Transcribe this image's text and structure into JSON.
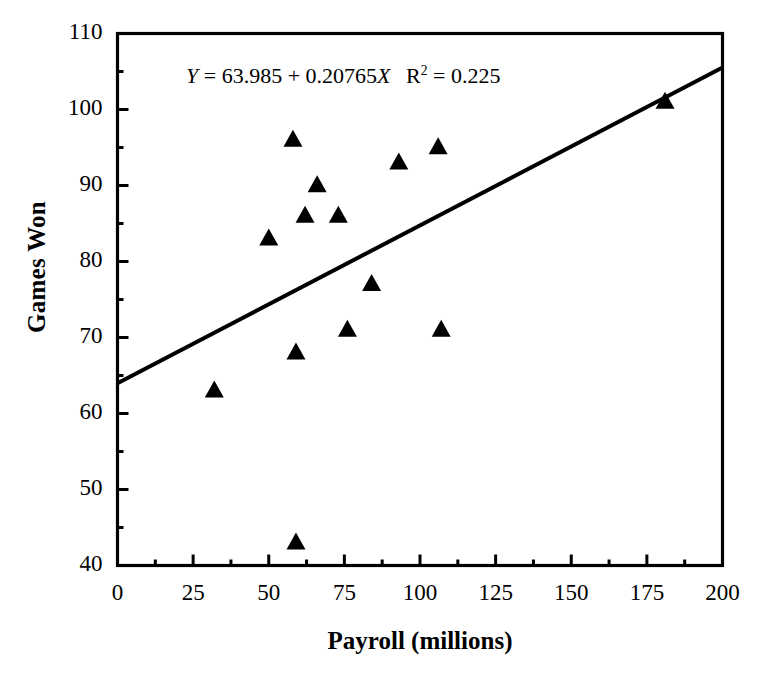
{
  "chart_data": {
    "type": "scatter",
    "title": "",
    "xlabel": "Payroll (millions)",
    "ylabel": "Games Won",
    "xlim": [
      0,
      200
    ],
    "ylim": [
      40,
      110
    ],
    "xticks": [
      0,
      25,
      50,
      75,
      100,
      125,
      150,
      175,
      200
    ],
    "yticks": [
      40,
      50,
      60,
      70,
      80,
      90,
      100,
      110
    ],
    "xminor_step": 12.5,
    "yminor_step": 5,
    "grid": false,
    "legend": null,
    "marker": "triangle-up",
    "marker_color": "#000000",
    "points": [
      {
        "x": 32,
        "y": 63
      },
      {
        "x": 50,
        "y": 83
      },
      {
        "x": 58,
        "y": 96
      },
      {
        "x": 59,
        "y": 68
      },
      {
        "x": 59,
        "y": 43
      },
      {
        "x": 62,
        "y": 86
      },
      {
        "x": 66,
        "y": 90
      },
      {
        "x": 73,
        "y": 86
      },
      {
        "x": 76,
        "y": 71
      },
      {
        "x": 84,
        "y": 77
      },
      {
        "x": 93,
        "y": 93
      },
      {
        "x": 106,
        "y": 95
      },
      {
        "x": 107,
        "y": 71
      },
      {
        "x": 181,
        "y": 101
      }
    ],
    "fit_line": {
      "intercept": 63.985,
      "slope": 0.20765,
      "r_squared": 0.225,
      "x_start": 0,
      "x_end": 200,
      "y_start": 63.985,
      "y_end": 105.515
    },
    "annotation": {
      "full_text": "Y = 63.985 + 0.20765X  R2 = 0.225",
      "y_symbol": "Y",
      "eq1": "=",
      "intercept_text": "63.985",
      "plus": "+",
      "slope_text": "0.20765",
      "x_symbol": "X",
      "r_symbol": "R",
      "r_exponent": "2",
      "eq2": "=",
      "r_squared_text": "0.225"
    }
  },
  "axes": {
    "ylabel": "Games Won",
    "xlabel": "Payroll (millions)",
    "ytick_labels": [
      "110",
      "100",
      "90",
      "80",
      "70",
      "60",
      "50",
      "40"
    ],
    "xtick_labels": [
      "0",
      "25",
      "50",
      "75",
      "100",
      "125",
      "150",
      "175",
      "200"
    ]
  },
  "style": {
    "axis_color": "#000000",
    "marker_color": "#000000",
    "line_color": "#000000",
    "background": "#ffffff"
  }
}
